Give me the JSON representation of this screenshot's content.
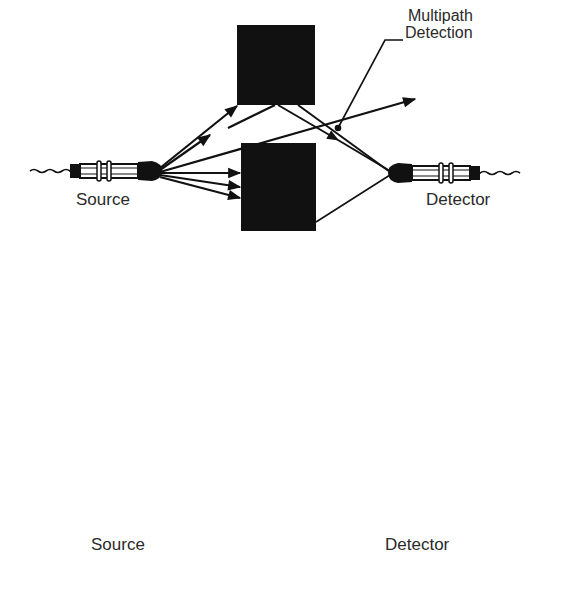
{
  "figure": {
    "colors": {
      "ink": "#111111",
      "background": "#ffffff",
      "label": "#2a2a2a"
    },
    "top_panel": {
      "callout": {
        "line1": "Multipath",
        "line2": "Detection"
      },
      "source_label": "Source",
      "detector_label": "Detector",
      "source_icon": "photoelectric-sensor-icon",
      "detector_icon": "photoelectric-sensor-icon"
    },
    "bottom_panel": {
      "source_label": "Source",
      "detector_label": "Detector",
      "source_icon": "hooded-photoelectric-sensor-icon",
      "detector_icon": "hooded-photoelectric-sensor-icon"
    }
  }
}
